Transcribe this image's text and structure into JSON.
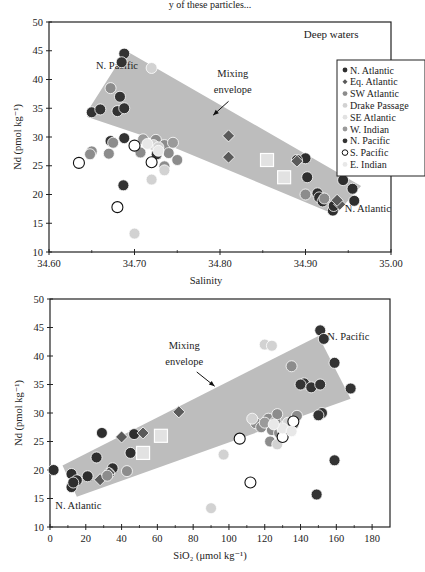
{
  "header_fragment": "y of these particles...",
  "colors": {
    "N. Atlantic": "#2e2e2e",
    "Eq. Atlantic": "#5a5a5a",
    "SW Atlantic": "#8c8c8c",
    "Drake Passage": "#d2d2d2",
    "SE Atlantic": "#e2e2e2",
    "W. Indian": "#9a9a9a",
    "N. Pacific": "#333333",
    "S. Pacific": "#ffffff",
    "E. Indian": "#e8e8e8",
    "envelope": "#bdbdbd"
  },
  "chart_data": [
    {
      "type": "scatter",
      "title": "Deep waters",
      "xlabel": "Salinity",
      "ylabel": "Nd (pmol kg⁻¹)",
      "xlim": [
        34.6,
        35.0
      ],
      "ylim": [
        10,
        50
      ],
      "xticks": [
        "34.60",
        "34.70",
        "34.80",
        "34.90",
        "35.00"
      ],
      "xtick_values": [
        34.6,
        34.7,
        34.8,
        34.9,
        35.0
      ],
      "xminor": [
        34.65,
        34.75,
        34.85,
        34.95
      ],
      "yticks": [
        "10",
        "15",
        "20",
        "25",
        "30",
        "35",
        "40",
        "45",
        "50"
      ],
      "ytick_values": [
        10,
        15,
        20,
        25,
        30,
        35,
        40,
        45,
        50
      ],
      "grid": false,
      "legend_position": "right",
      "legend": [
        "N. Atlantic",
        "Eq. Atlantic",
        "SW Atlantic",
        "Drake Passage",
        "SE Atlantic",
        "W. Indian",
        "N. Pacific",
        "S. Pacific",
        "E. Indian"
      ],
      "annotations": [
        {
          "text": "N. Pacific",
          "x": 34.655,
          "y": 41.8
        },
        {
          "text": "Mixing",
          "x": 34.815,
          "y": 40.5
        },
        {
          "text": "envelope",
          "x": 34.815,
          "y": 37.6
        },
        {
          "text": "N. Atlantic",
          "x": 34.946,
          "y": 17.0
        }
      ],
      "envelope": [
        [
          34.645,
          34.5
        ],
        [
          34.69,
          45.0
        ],
        [
          34.965,
          21.5
        ],
        [
          34.935,
          16.5
        ],
        [
          34.725,
          29.5
        ],
        [
          34.645,
          33.5
        ]
      ],
      "arrow": {
        "from": [
          34.81,
          36.2
        ],
        "to": [
          34.792,
          33.8
        ]
      },
      "series": [
        {
          "name": "N. Pacific",
          "marker": "circle",
          "points": [
            [
              34.688,
              44.5
            ],
            [
              34.685,
              43.0
            ],
            [
              34.683,
              37.0
            ],
            [
              34.65,
              34.3
            ],
            [
              34.66,
              34.8
            ],
            [
              34.68,
              34.5
            ],
            [
              34.688,
              35.0
            ],
            [
              34.672,
              29.3
            ],
            [
              34.688,
              29.8
            ],
            [
              34.687,
              21.6
            ],
            [
              34.726,
              27.0
            ]
          ]
        },
        {
          "name": "N. Atlantic",
          "marker": "circle",
          "points": [
            [
              34.9,
              26.3
            ],
            [
              34.902,
              23.0
            ],
            [
              34.914,
              20.2
            ],
            [
              34.916,
              19.5
            ],
            [
              34.92,
              18.8
            ],
            [
              34.932,
              17.2
            ],
            [
              34.933,
              18.0
            ],
            [
              34.95,
              26.0
            ],
            [
              34.944,
              22.5
            ],
            [
              34.955,
              21.0
            ],
            [
              34.957,
              18.9
            ],
            [
              34.89,
              26.0
            ]
          ]
        },
        {
          "name": "Eq. Atlantic",
          "marker": "diamond",
          "points": [
            [
              34.81,
              30.2
            ],
            [
              34.81,
              26.5
            ],
            [
              34.89,
              25.8
            ],
            [
              34.94,
              18.3
            ],
            [
              34.937,
              19.0
            ]
          ]
        },
        {
          "name": "SW Atlantic",
          "marker": "circle",
          "points": [
            [
              34.65,
              27.5
            ],
            [
              34.648,
              27.0
            ],
            [
              34.67,
              27.1
            ],
            [
              34.675,
              29.0
            ],
            [
              34.707,
              27.3
            ],
            [
              34.725,
              29.5
            ],
            [
              34.735,
              28.6
            ],
            [
              34.74,
              27.2
            ],
            [
              34.75,
              26.0
            ],
            [
              34.735,
              24.9
            ],
            [
              34.9,
              20.0
            ],
            [
              34.922,
              19.3
            ],
            [
              34.672,
              38.5
            ]
          ]
        },
        {
          "name": "Drake Passage",
          "marker": "circle",
          "points": [
            [
              34.72,
              42.0
            ],
            [
              34.722,
              28.6
            ],
            [
              34.72,
              22.6
            ],
            [
              34.7,
              13.2
            ],
            [
              34.728,
              28.2
            ],
            [
              34.735,
              24.2
            ]
          ]
        },
        {
          "name": "SE Atlantic",
          "marker": "square",
          "points": [
            [
              34.855,
              26.0
            ],
            [
              34.875,
              23.0
            ]
          ]
        },
        {
          "name": "W. Indian",
          "marker": "circle",
          "points": [
            [
              34.745,
              29.0
            ],
            [
              34.71,
              29.6
            ]
          ]
        },
        {
          "name": "S. Pacific",
          "marker": "open-circle",
          "points": [
            [
              34.635,
              25.5
            ],
            [
              34.68,
              17.8
            ],
            [
              34.7,
              28.5
            ],
            [
              34.72,
              25.6
            ]
          ]
        },
        {
          "name": "E. Indian",
          "marker": "circle",
          "points": [
            [
              34.728,
              27.6
            ],
            [
              34.715,
              28.8
            ]
          ]
        }
      ]
    },
    {
      "type": "scatter",
      "title": "",
      "xlabel": "SiO₂ (μmol kg⁻¹)",
      "ylabel": "Nd (pmol kg⁻¹)",
      "xlim": [
        0,
        190
      ],
      "ylim": [
        10,
        50
      ],
      "xticks": [
        "0",
        "20",
        "40",
        "60",
        "80",
        "100",
        "120",
        "140",
        "160",
        "180"
      ],
      "xtick_values": [
        0,
        20,
        40,
        60,
        80,
        100,
        120,
        140,
        160,
        180
      ],
      "xminor": [
        10,
        30,
        50,
        70,
        90,
        110,
        130,
        150,
        170
      ],
      "yticks": [
        "10",
        "15",
        "20",
        "25",
        "30",
        "35",
        "40",
        "45",
        "50"
      ],
      "ytick_values": [
        10,
        15,
        20,
        25,
        30,
        35,
        40,
        45,
        50
      ],
      "grid": false,
      "legend_position": "none",
      "annotations": [
        {
          "text": "N. Pacific",
          "x": 155,
          "y": 42.8
        },
        {
          "text": "Mixing",
          "x": 75,
          "y": 41.2
        },
        {
          "text": "envelope",
          "x": 75,
          "y": 38.4
        },
        {
          "text": "N. Atlantic",
          "x": 3,
          "y": 13.2
        }
      ],
      "envelope": [
        [
          7,
          20.8
        ],
        [
          150,
          43.5
        ],
        [
          168,
          32.5
        ],
        [
          15,
          15.3
        ]
      ],
      "arrow": {
        "from": [
          82,
          37.2
        ],
        "to": [
          92,
          34.7
        ]
      },
      "series": [
        {
          "name": "N. Pacific",
          "marker": "circle",
          "points": [
            [
              151,
              44.5
            ],
            [
              153,
              43.0
            ],
            [
              159,
              38.8
            ],
            [
              142,
              35.2
            ],
            [
              140,
              35.0
            ],
            [
              146,
              34.5
            ],
            [
              151,
              35.0
            ],
            [
              168,
              34.3
            ],
            [
              152,
              30.0
            ],
            [
              150,
              29.6
            ],
            [
              159,
              21.7
            ],
            [
              149,
              15.7
            ]
          ]
        },
        {
          "name": "N. Atlantic",
          "marker": "circle",
          "points": [
            [
              2,
              20.0
            ],
            [
              12,
              19.3
            ],
            [
              15,
              18.2
            ],
            [
              12,
              17.0
            ],
            [
              13,
              17.8
            ],
            [
              21,
              18.9
            ],
            [
              26,
              22.2
            ],
            [
              29,
              26.5
            ],
            [
              35,
              20.3
            ],
            [
              45,
              23.0
            ],
            [
              47,
              26.3
            ],
            [
              33,
              19.4
            ]
          ]
        },
        {
          "name": "Eq. Atlantic",
          "marker": "diamond",
          "points": [
            [
              28,
              18.3
            ],
            [
              40,
              25.8
            ],
            [
              52,
              26.5
            ],
            [
              72,
              30.2
            ],
            [
              33,
              19.5
            ]
          ]
        },
        {
          "name": "SW Atlantic",
          "marker": "circle",
          "points": [
            [
              32,
              19.0
            ],
            [
              43,
              19.8
            ],
            [
              115,
              28.2
            ],
            [
              118,
              27.5
            ],
            [
              122,
              29.0
            ],
            [
              124,
              27.0
            ],
            [
              126,
              28.5
            ],
            [
              128,
              26.5
            ],
            [
              131,
              27.6
            ],
            [
              136,
              28.0
            ],
            [
              123,
              25.0
            ],
            [
              135,
              38.2
            ],
            [
              138,
              29.5
            ],
            [
              127,
              29.8
            ]
          ]
        },
        {
          "name": "Drake Passage",
          "marker": "circle",
          "points": [
            [
              90,
              13.3
            ],
            [
              97,
              22.7
            ],
            [
              120,
              42.0
            ],
            [
              124,
              41.8
            ],
            [
              113,
              29.0
            ],
            [
              127,
              24.5
            ],
            [
              133,
              28.3
            ]
          ]
        },
        {
          "name": "SE Atlantic",
          "marker": "square",
          "points": [
            [
              62,
              26.0
            ],
            [
              52,
              23.0
            ]
          ]
        },
        {
          "name": "W. Indian",
          "marker": "circle",
          "points": [
            [
              120,
              28.3
            ],
            [
              130,
              27.0
            ]
          ]
        },
        {
          "name": "S. Pacific",
          "marker": "open-circle",
          "points": [
            [
              106,
              25.5
            ],
            [
              112,
              17.8
            ],
            [
              130,
              25.8
            ],
            [
              136,
              28.5
            ]
          ]
        },
        {
          "name": "E. Indian",
          "marker": "circle",
          "points": [
            [
              130,
              27.3
            ],
            [
              135,
              26.8
            ],
            [
              125,
              28.0
            ]
          ]
        }
      ]
    }
  ]
}
